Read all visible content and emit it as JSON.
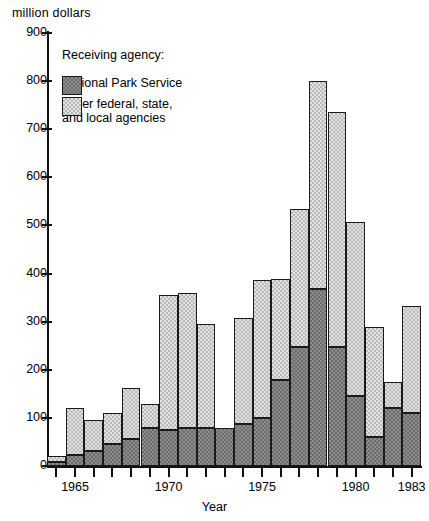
{
  "chart_data": {
    "type": "bar",
    "subtype": "stacked-bar",
    "title": "",
    "ylabel": "million dollars",
    "xlabel": "Year",
    "ylim": [
      0,
      900
    ],
    "ytick_step": 100,
    "yticks": [
      0,
      100,
      200,
      300,
      400,
      500,
      600,
      700,
      800,
      900
    ],
    "ytick_labels": [
      "0",
      "100",
      "200",
      "300",
      "400",
      "500",
      "600",
      "700",
      "800",
      "900"
    ],
    "grid": false,
    "legend_position": "upper-left-inside",
    "legend_title": "Receiving agency:",
    "categories": [
      "1964",
      "1965",
      "1966",
      "1967",
      "1968",
      "1969",
      "1970",
      "1971",
      "1972",
      "1973",
      "1974",
      "1975",
      "1976",
      "1977",
      "1978",
      "1979",
      "1980",
      "1981",
      "1982",
      "1983"
    ],
    "x_axis_tick_labels": [
      "1965",
      "1970",
      "1975",
      "1980",
      "1983"
    ],
    "x_axis_tick_categories": [
      "1965",
      "1970",
      "1975",
      "1980",
      "1983"
    ],
    "series": [
      {
        "name": "National Park Service",
        "color": "#8c8c8c",
        "pattern": "dark-checker",
        "values": [
          8,
          22,
          32,
          45,
          57,
          78,
          75,
          78,
          78,
          78,
          88,
          100,
          178,
          248,
          367,
          248,
          145,
          60,
          120,
          110
        ]
      },
      {
        "name": "Other federal, state, and local agencies",
        "color": "#e2e2e2",
        "pattern": "light-checker",
        "values": [
          12,
          98,
          63,
          66,
          105,
          50,
          280,
          282,
          218,
          0,
          220,
          287,
          210,
          287,
          433,
          487,
          362,
          228,
          55,
          223
        ]
      }
    ],
    "totals": [
      20,
      120,
      95,
      111,
      162,
      128,
      355,
      360,
      296,
      78,
      308,
      387,
      388,
      535,
      800,
      735,
      507,
      288,
      175,
      333
    ]
  },
  "legend": {
    "title": "Receiving agency:",
    "items": [
      {
        "label": "National Park Service",
        "swatch": "dark-checker"
      },
      {
        "label": "Other federal, state,\nand local agencies",
        "swatch": "light-checker"
      }
    ]
  },
  "axes": {
    "y_title": "million dollars",
    "x_title": "Year"
  }
}
